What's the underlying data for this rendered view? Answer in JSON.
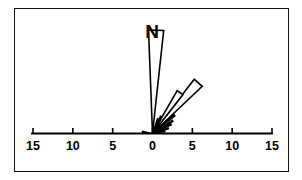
{
  "figure": {
    "background_color": "#ffffff",
    "frame_color": "#111111",
    "north_label": "N"
  },
  "chart_data": {
    "type": "bar",
    "subtype": "rose-diagram",
    "title": "N",
    "xlabel": "",
    "ylabel": "",
    "axis_labels": [
      "15",
      "10",
      "5",
      "0",
      "5",
      "10",
      "15"
    ],
    "axis_tick_values": [
      -15,
      -10,
      -5,
      0,
      5,
      10,
      15
    ],
    "axis_units_per_tick": 5,
    "xlim": [
      -15,
      15
    ],
    "radial_max": 15,
    "grid": false,
    "legend": null,
    "categories": [
      "N (0°)",
      "NNE (18°)",
      "NE (35°)",
      "NE (42°)",
      "ENE (50°)",
      "ENE (58°)",
      "ENE (66°)",
      "E (74°)",
      "E (82°)",
      "WNW (-82°)"
    ],
    "values": [
      13.0,
      2.0,
      6.0,
      8.5,
      3.5,
      3.0,
      2.5,
      2.0,
      1.5,
      1.2
    ],
    "series": [
      {
        "name": "frequency",
        "values": [
          13.0,
          2.0,
          6.0,
          8.5,
          3.5,
          3.0,
          2.5,
          2.0,
          1.5,
          1.2
        ]
      }
    ],
    "petals": [
      {
        "name": "petal-north",
        "azimuth_deg": 2,
        "half_width_deg": 4.2,
        "radius": 13.0,
        "style": "outline"
      },
      {
        "name": "petal-ne-outer",
        "azimuth_deg": 42,
        "half_width_deg": 4.5,
        "radius": 8.6,
        "style": "outline"
      },
      {
        "name": "petal-ne-inner",
        "azimuth_deg": 34,
        "half_width_deg": 4.0,
        "radius": 6.2,
        "style": "outline"
      },
      {
        "name": "petal-ene-a",
        "azimuth_deg": 50,
        "half_width_deg": 2.0,
        "radius": 3.6,
        "style": "solid"
      },
      {
        "name": "petal-ene-b",
        "azimuth_deg": 58,
        "half_width_deg": 2.0,
        "radius": 3.0,
        "style": "solid"
      },
      {
        "name": "petal-ene-c",
        "azimuth_deg": 64,
        "half_width_deg": 2.0,
        "radius": 2.6,
        "style": "solid"
      },
      {
        "name": "petal-e-a",
        "azimuth_deg": 72,
        "half_width_deg": 2.0,
        "radius": 2.1,
        "style": "solid"
      },
      {
        "name": "petal-e-b",
        "azimuth_deg": 80,
        "half_width_deg": 2.0,
        "radius": 1.6,
        "style": "solid"
      },
      {
        "name": "petal-nne",
        "azimuth_deg": 20,
        "half_width_deg": 2.0,
        "radius": 2.0,
        "style": "solid"
      },
      {
        "name": "petal-nne-2",
        "azimuth_deg": 26,
        "half_width_deg": 1.8,
        "radius": 2.4,
        "style": "solid"
      },
      {
        "name": "petal-wnw",
        "azimuth_deg": -80,
        "half_width_deg": 3.0,
        "radius": 1.3,
        "style": "solid"
      }
    ]
  }
}
